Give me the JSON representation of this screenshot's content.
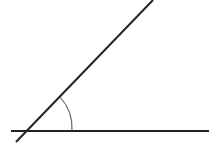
{
  "diagram": {
    "type": "angle",
    "colors": {
      "background": "#ffffff",
      "line": "#222222",
      "arc": "#444444"
    },
    "vertex": {
      "x": 26,
      "y": 131
    },
    "horizontal_line": {
      "x1": 11,
      "y1": 131,
      "x2": 209,
      "y2": 131
    },
    "inclined_line": {
      "x1": 16,
      "y1": 142,
      "x2": 153,
      "y2": 0
    },
    "angle_arc": {
      "start_x": 60,
      "start_y": 97,
      "end_x": 72,
      "end_y": 131,
      "radius": 46
    }
  }
}
